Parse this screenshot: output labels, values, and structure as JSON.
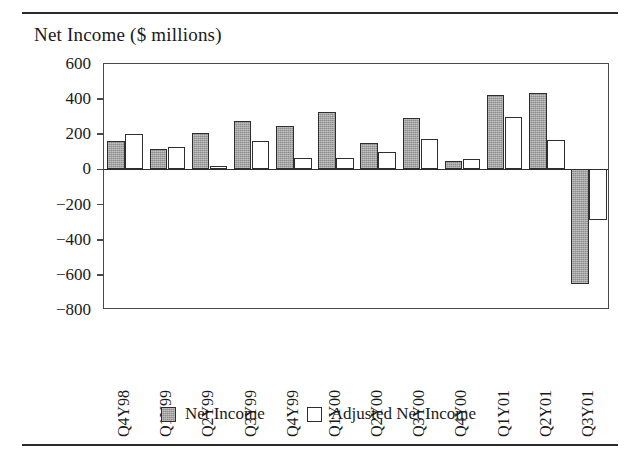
{
  "figure": {
    "title": "Net Income ($ millions)",
    "has_top_rule": true,
    "has_bottom_rule": true
  },
  "legend": {
    "position": "bottom-center",
    "entries": [
      {
        "label": "Net Income",
        "swatch": "dark-hatched-square"
      },
      {
        "label": "Adjusted Net Income",
        "swatch": "white-outlined-square"
      }
    ]
  },
  "axes": {
    "y_ticks": [
      "600",
      "400",
      "200",
      "0",
      "−200",
      "−400",
      "−600",
      "−800"
    ],
    "y_tick_values": [
      600,
      400,
      200,
      0,
      -200,
      -400,
      -600,
      -800
    ],
    "y_min": -800,
    "y_max": 600
  },
  "chart_data": {
    "type": "bar",
    "title": "Net Income ($ millions)",
    "xlabel": "",
    "ylabel": "Net Income ($ millions)",
    "ylim": [
      -800,
      600
    ],
    "ytick_step": 200,
    "grid": false,
    "legend_position": "bottom-center",
    "categories": [
      "Q4Y98",
      "Q1Y99",
      "Q2Y99",
      "Q3Y99",
      "Q4Y99",
      "Q1Y00",
      "Q2Y00",
      "Q3Y00",
      "Q4Y00",
      "Q1Y01",
      "Q2Y01",
      "Q3Y01"
    ],
    "series": [
      {
        "name": "Net Income",
        "color": "#8c8c8c",
        "values": [
          160,
          115,
          210,
          275,
          245,
          325,
          150,
          290,
          50,
          425,
          435,
          -650
        ]
      },
      {
        "name": "Adjusted Net Income",
        "color": "#ffffff",
        "values": [
          200,
          125,
          20,
          160,
          65,
          65,
          100,
          175,
          60,
          300,
          165,
          -285
        ]
      }
    ]
  }
}
